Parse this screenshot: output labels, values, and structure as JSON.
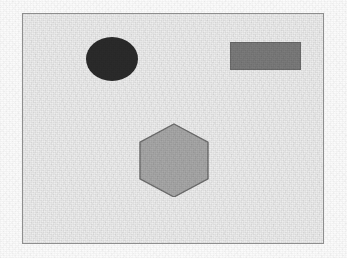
{
  "figure": {
    "title": "",
    "background_color": "#ededed",
    "border_color": "#8e8e8e",
    "page_color": "#fbfbfb",
    "frame": {
      "x": 22,
      "y": 13,
      "width": 302,
      "height": 231
    },
    "texture": "scanned-paper-grain"
  },
  "shapes": [
    {
      "id": "ellipse",
      "name": "dark-ellipse",
      "type": "ellipse",
      "label": "Ellipse",
      "fill_color": "#2b2b2b",
      "stroke_color": "#2b2b2b",
      "center": {
        "x": 111,
        "y": 58
      },
      "radius_x": 26,
      "radius_y": 22,
      "bbox": {
        "x": 85,
        "y": 36,
        "width": 52,
        "height": 44
      }
    },
    {
      "id": "rectangle",
      "name": "grey-rectangle",
      "type": "rectangle",
      "label": "Rectangle",
      "fill_color": "#7b7b7b",
      "stroke_color": "#6a6a6a",
      "center": {
        "x": 264,
        "y": 55
      },
      "bbox": {
        "x": 229,
        "y": 41,
        "width": 71,
        "height": 28
      }
    },
    {
      "id": "hexagon",
      "name": "light-grey-hexagon",
      "type": "hexagon",
      "label": "Hexagon",
      "orientation": "pointy-top",
      "fill_color": "#a8a8a8",
      "stroke_color": "#6e6e6e",
      "center": {
        "x": 173,
        "y": 159
      },
      "bbox": {
        "x": 137,
        "y": 122,
        "width": 72,
        "height": 74
      },
      "points": "36,1 70,19.25 70,55.75 36,74 2,55.75 2,19.25"
    }
  ]
}
